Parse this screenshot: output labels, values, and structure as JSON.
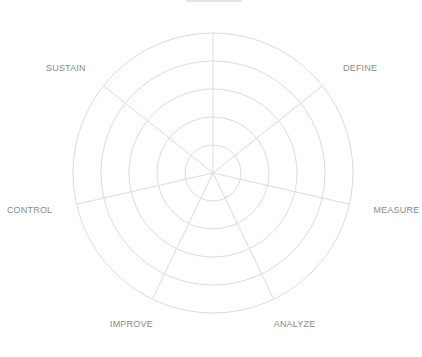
{
  "chart_data": {
    "type": "radar",
    "title": "",
    "axes": [
      "",
      "DEFINE",
      "MEASURE",
      "ANALYZE",
      "IMPROVE",
      "CONTROL",
      "SUSTAIN"
    ],
    "axes_note": "First (top) axis label is clipped at the top edge and unreadable",
    "series": [],
    "rings": 5,
    "grid": true,
    "legend": "none"
  },
  "style": {
    "grid_color": "#dcdcdc",
    "label_color": "#8a8a8a",
    "background": "#ffffff"
  },
  "geometry": {
    "cx": 213,
    "cy": 173,
    "radius": 140
  }
}
